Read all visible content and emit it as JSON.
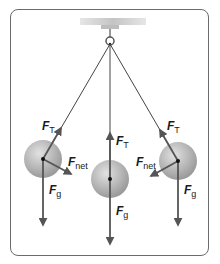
{
  "diagram": {
    "colors": {
      "frame": "#6b6b6b",
      "string": "#444444",
      "vector": "#555555",
      "bob": "#b0b0b0",
      "bob_light": "#dcdcdc",
      "ceiling": "#c8c8c8"
    },
    "labels": {
      "left": {
        "tension": "F",
        "tension_sub": "T",
        "net": "F",
        "net_sub": "net",
        "gravity": "F",
        "gravity_sub": "g"
      },
      "center": {
        "tension": "F",
        "tension_sub": "T",
        "gravity": "F",
        "gravity_sub": "g"
      },
      "right": {
        "tension": "F",
        "tension_sub": "T",
        "net": "F",
        "net_sub": "net",
        "gravity": "F",
        "gravity_sub": "g"
      }
    }
  }
}
